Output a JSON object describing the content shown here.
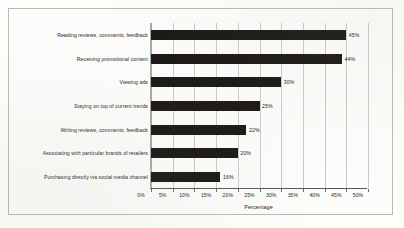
{
  "chart_data": {
    "type": "bar",
    "orientation": "horizontal",
    "title": "",
    "xlabel": "Percentage",
    "ylabel": "",
    "xlim": [
      0,
      50
    ],
    "grid": true,
    "legend": false,
    "categories": [
      "Reading reviews, comments, feedback",
      "Receiving promotional content",
      "Viewing ads",
      "Staying on top of current trends",
      "Writing reviews, comments, feedback",
      "Associating with particular brands of retailers",
      "Purchasing directly via social media channel"
    ],
    "values": [
      45,
      44,
      30,
      25,
      22,
      20,
      16
    ],
    "data_labels": [
      "45%",
      "44%",
      "30%",
      "25%",
      "22%",
      "20%",
      "16%"
    ],
    "xticks": [
      0,
      5,
      10,
      15,
      20,
      25,
      30,
      35,
      40,
      45,
      50
    ],
    "xtick_labels": [
      "0%",
      "5%",
      "10%",
      "15%",
      "20%",
      "25%",
      "30%",
      "35%",
      "40%",
      "45%",
      "50%"
    ],
    "colors": {
      "bar": "#1a1714",
      "gridline": "#c9c9c6",
      "axis": "#59595a",
      "background": "#fcfcfa",
      "frame": "#b9b9b4",
      "text": "#2a2724"
    }
  }
}
